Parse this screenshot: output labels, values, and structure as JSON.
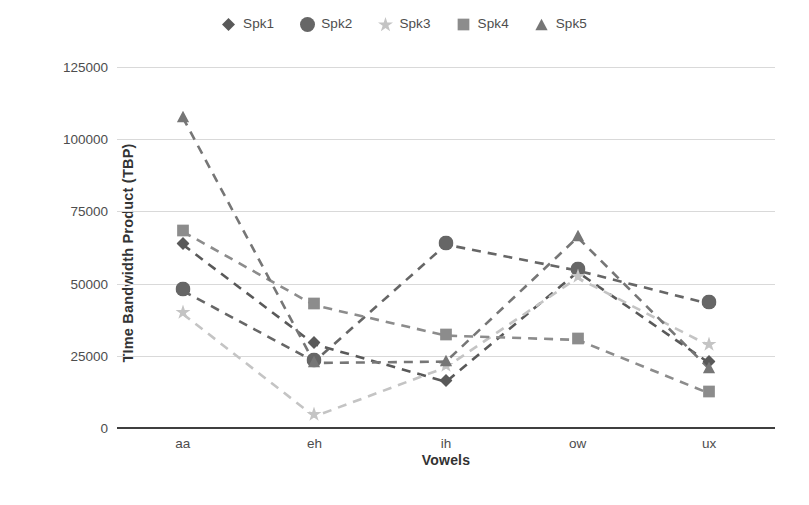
{
  "chart_data": {
    "type": "line",
    "title": "",
    "xlabel": "Vowels",
    "ylabel": "TIme Bandwidth Product (TBP)",
    "categories": [
      "aa",
      "eh",
      "ih",
      "ow",
      "ux"
    ],
    "ylim": [
      0,
      125000
    ],
    "ytick_labels": [
      "125000",
      "100000",
      "75000",
      "50000",
      "25000",
      "0"
    ],
    "ytick_values": [
      125000,
      100000,
      75000,
      50000,
      25000,
      0
    ],
    "grid": true,
    "legend_position": "top-center",
    "line_style": "dashed",
    "series": [
      {
        "name": "Spk1",
        "marker": "diamond",
        "color": "#595959",
        "values": [
          63500,
          29000,
          16000,
          54000,
          22500
        ]
      },
      {
        "name": "Spk2",
        "marker": "circle",
        "color": "#666666",
        "values": [
          47500,
          23000,
          63500,
          54500,
          43000
        ]
      },
      {
        "name": "Spk3",
        "marker": "star",
        "color": "#c4c4c4",
        "values": [
          39500,
          4000,
          21000,
          52000,
          28500
        ]
      },
      {
        "name": "Spk4",
        "marker": "square",
        "color": "#8c8c8c",
        "values": [
          68000,
          42500,
          32000,
          30500,
          12000
        ]
      },
      {
        "name": "Spk5",
        "marker": "triangle",
        "color": "#767676",
        "values": [
          107500,
          22500,
          23000,
          66000,
          20500
        ]
      }
    ]
  },
  "legend": {
    "items": [
      {
        "label": "Spk1"
      },
      {
        "label": "Spk2"
      },
      {
        "label": "Spk3"
      },
      {
        "label": "Spk4"
      },
      {
        "label": "Spk5"
      }
    ]
  },
  "axes": {
    "x_title": "Vowels",
    "y_title": "TIme Bandwidth Product (TBP)"
  }
}
